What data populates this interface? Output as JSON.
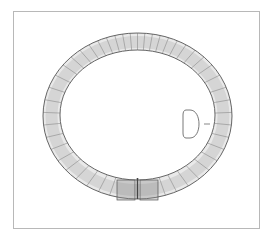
{
  "figure": {
    "colors": {
      "frame": "#b8b8b8",
      "line": "#555555",
      "hatch": "#8a8a8a",
      "background": "#ffffff"
    },
    "ring": {
      "outer": {
        "cx": 137.5,
        "cy": 116,
        "rx": 94.5,
        "ry": 83
      },
      "inner": {
        "cx": 137.5,
        "cy": 115,
        "rx": 77.5,
        "ry": 65
      }
    },
    "section_profile": {
      "x": 183,
      "y": 110,
      "w": 15,
      "h": 28
    }
  }
}
